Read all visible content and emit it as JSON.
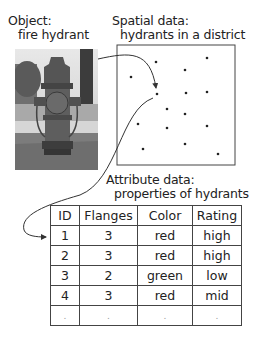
{
  "object": {
    "title": "Object:",
    "subtitle": "fire hydrant",
    "image": "fire-hydrant-photo"
  },
  "spatial": {
    "title": "Spatial data:",
    "subtitle": "hydrants in a district",
    "box": {
      "x": 117,
      "y": 45,
      "w": 118,
      "h": 120
    },
    "points": [
      [
        156,
        62
      ],
      [
        207,
        58
      ],
      [
        131,
        77
      ],
      [
        185,
        70
      ],
      [
        157,
        94
      ],
      [
        186,
        93
      ],
      [
        207,
        92
      ],
      [
        167,
        109
      ],
      [
        185,
        114
      ],
      [
        138,
        124
      ],
      [
        167,
        128
      ],
      [
        207,
        126
      ],
      [
        143,
        149
      ],
      [
        185,
        144
      ],
      [
        218,
        154
      ]
    ]
  },
  "attribute": {
    "title": "Attribute data:",
    "subtitle": "properties of hydrants",
    "columns": [
      "ID",
      "Flanges",
      "Color",
      "Rating"
    ],
    "rows": [
      [
        "1",
        "3",
        "red",
        "high"
      ],
      [
        "2",
        "3",
        "red",
        "high"
      ],
      [
        "3",
        "2",
        "green",
        "low"
      ],
      [
        "4",
        "3",
        "red",
        "mid"
      ],
      [
        ".",
        ".",
        ".",
        "."
      ]
    ]
  },
  "colors": {
    "line": "#333333",
    "text": "#222222",
    "background": "#ffffff"
  }
}
